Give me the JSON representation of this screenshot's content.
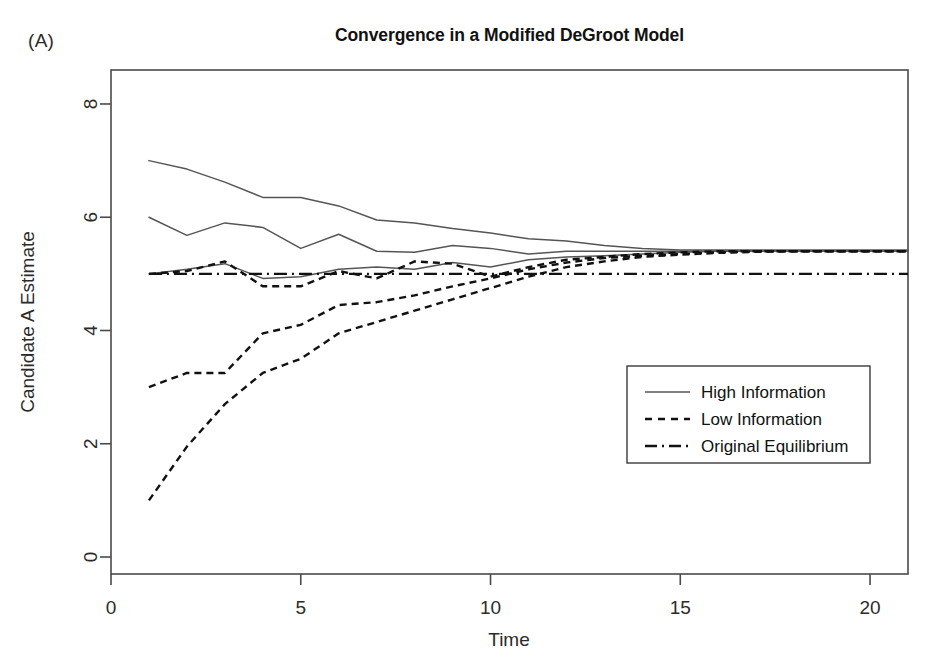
{
  "panel": {
    "label": "(A)"
  },
  "chart_data": {
    "type": "line",
    "title": "Convergence in a Modified DeGroot Model",
    "xlabel": "Time",
    "ylabel": "Candidate A Estimate",
    "xlim": [
      0,
      21
    ],
    "ylim": [
      -0.3,
      8.6
    ],
    "xticks": [
      0,
      5,
      10,
      15,
      20
    ],
    "yticks": [
      0,
      2,
      4,
      6,
      8
    ],
    "xtick_labels": [
      "0",
      "5",
      "10",
      "15",
      "20"
    ],
    "ytick_labels": [
      "0",
      "2",
      "4",
      "6",
      "8"
    ],
    "grid": false,
    "legend_position": "bottom-right",
    "x": [
      1,
      2,
      3,
      4,
      5,
      6,
      7,
      8,
      9,
      10,
      11,
      12,
      13,
      14,
      15,
      16,
      17,
      18,
      19,
      20,
      21
    ],
    "series": [
      {
        "name": "High Information",
        "style": "solid",
        "color": "#555555",
        "values": [
          7.0,
          6.85,
          6.62,
          6.35,
          6.35,
          6.2,
          5.95,
          5.9,
          5.8,
          5.72,
          5.62,
          5.58,
          5.5,
          5.45,
          5.42,
          5.42,
          5.42,
          5.42,
          5.42,
          5.42,
          5.42
        ]
      },
      {
        "name": "High Information",
        "style": "solid",
        "color": "#555555",
        "values": [
          6.0,
          5.68,
          5.9,
          5.82,
          5.45,
          5.7,
          5.4,
          5.38,
          5.5,
          5.45,
          5.35,
          5.4,
          5.4,
          5.4,
          5.4,
          5.4,
          5.4,
          5.4,
          5.4,
          5.4,
          5.4
        ]
      },
      {
        "name": "High Information",
        "style": "solid",
        "color": "#555555",
        "values": [
          5.0,
          5.08,
          5.18,
          4.92,
          4.95,
          5.08,
          5.12,
          5.08,
          5.2,
          5.12,
          5.25,
          5.3,
          5.32,
          5.35,
          5.38,
          5.4,
          5.4,
          5.4,
          5.4,
          5.4,
          5.4
        ]
      },
      {
        "name": "Low Information",
        "style": "dashed",
        "color": "#111111",
        "values": [
          5.0,
          5.05,
          5.22,
          4.78,
          4.78,
          5.05,
          4.92,
          5.22,
          5.18,
          4.95,
          5.12,
          5.25,
          5.3,
          5.35,
          5.38,
          5.4,
          5.4,
          5.4,
          5.4,
          5.4,
          5.4
        ]
      },
      {
        "name": "Low Information",
        "style": "dashed",
        "color": "#111111",
        "values": [
          3.0,
          3.25,
          3.25,
          3.95,
          4.1,
          4.45,
          4.5,
          4.62,
          4.78,
          4.92,
          5.08,
          5.2,
          5.28,
          5.32,
          5.35,
          5.38,
          5.4,
          5.4,
          5.4,
          5.4,
          5.4
        ]
      },
      {
        "name": "Low Information",
        "style": "dashed",
        "color": "#111111",
        "values": [
          1.0,
          1.95,
          2.7,
          3.25,
          3.5,
          3.95,
          4.15,
          4.35,
          4.55,
          4.75,
          4.95,
          5.12,
          5.22,
          5.3,
          5.34,
          5.37,
          5.39,
          5.4,
          5.4,
          5.4,
          5.4
        ]
      },
      {
        "name": "Original Equilibrium",
        "style": "dashdot",
        "color": "#111111",
        "values": [
          5.0,
          5.0,
          5.0,
          5.0,
          5.0,
          5.0,
          5.0,
          5.0,
          5.0,
          5.0,
          5.0,
          5.0,
          5.0,
          5.0,
          5.0,
          5.0,
          5.0,
          5.0,
          5.0,
          5.0,
          5.0
        ]
      }
    ],
    "legend": [
      {
        "label": "High Information",
        "style": "solid"
      },
      {
        "label": "Low Information",
        "style": "dashed"
      },
      {
        "label": "Original Equilibrium",
        "style": "dashdot"
      }
    ]
  }
}
